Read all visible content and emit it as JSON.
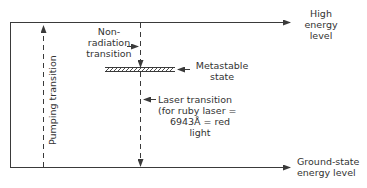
{
  "diagram": {
    "labels": {
      "high_energy": [
        "High",
        "energy",
        "level"
      ],
      "ground_state": [
        "Ground-state",
        "energy level"
      ],
      "non_radiation": [
        "Non-",
        "radiation",
        "transition"
      ],
      "metastable": [
        "Metastable",
        "state"
      ],
      "laser_transition": [
        "Laser transition",
        "(for ruby laser =",
        "6943Å = red",
        "light"
      ],
      "pumping": "Pumping transition"
    },
    "colors": {
      "line": "#3a3a3a",
      "background": "#ffffff"
    }
  }
}
